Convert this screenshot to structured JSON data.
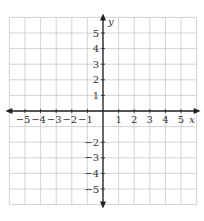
{
  "chart_data": {
    "type": "coordinate-grid",
    "title": "",
    "xlabel": "x",
    "ylabel": "y",
    "xlim": [
      -6,
      6
    ],
    "ylim": [
      -6,
      6
    ],
    "grid": true,
    "x_ticks": [
      -5,
      -4,
      -3,
      -2,
      -1,
      1,
      2,
      3,
      4,
      5
    ],
    "y_ticks": [
      -5,
      -4,
      -3,
      -2,
      1,
      2,
      3,
      4,
      5
    ],
    "x_tick_labels": [
      "−5",
      "−4",
      "−3",
      "−2",
      "−1",
      "1",
      "2",
      "3",
      "4",
      "5"
    ],
    "y_tick_labels": [
      "−5",
      "−4",
      "−3",
      "−2",
      "1",
      "2",
      "3",
      "4",
      "5"
    ]
  },
  "colors": {
    "grid": "#c8c8c8",
    "border": "#c8c8c8",
    "axis": "#222222",
    "text": "#333333"
  }
}
